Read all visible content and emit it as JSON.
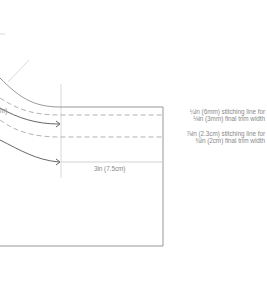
{
  "diagram": {
    "type": "sewing binding/hem stitching diagram",
    "annotations": [
      {
        "line1": "¼in (6mm) stitching line for",
        "line2": "⅛in (3mm) final trim width"
      },
      {
        "line1": "⅞in (2.3cm) stitching line for",
        "line2": "¾in (2cm) final trim width"
      }
    ],
    "dimension_label": "3in (7.5cm)",
    "partial_left_label": "m)",
    "colors": {
      "solid_line": "#8c8c8c",
      "dashed_line": "#9a9a9a",
      "arrow": "#555555",
      "guide_line": "#c8c8c8",
      "text": "#8a8a8a"
    }
  }
}
